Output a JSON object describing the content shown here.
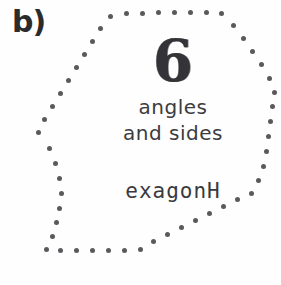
{
  "item": {
    "label": "b)"
  },
  "card": {
    "number": "6",
    "descriptor_line_1": "angles",
    "descriptor_line_2": "and sides",
    "shape_word": "exagonH"
  },
  "shape": {
    "name": "hexagon-outline",
    "sides": 6,
    "border_style": "dotted",
    "dot_color": "#5a5a5e",
    "dot_diameter_px": 5,
    "background_color": "#fefefe",
    "ink_color": "#3c3c40",
    "vertices": [
      [
        112,
        14
      ],
      [
        218,
        14
      ],
      [
        273,
        92
      ],
      [
        248,
        196
      ],
      [
        148,
        252
      ],
      [
        42,
        133
      ]
    ],
    "dot_path": [
      [
        38,
        132
      ],
      [
        44,
        119
      ],
      [
        52,
        106
      ],
      [
        60,
        93
      ],
      [
        68,
        80
      ],
      [
        76,
        67
      ],
      [
        84,
        54
      ],
      [
        92,
        41
      ],
      [
        100,
        28
      ],
      [
        110,
        16
      ],
      [
        126,
        13
      ],
      [
        142,
        13
      ],
      [
        158,
        12
      ],
      [
        174,
        12
      ],
      [
        190,
        12
      ],
      [
        206,
        12
      ],
      [
        221,
        13
      ],
      [
        233,
        25
      ],
      [
        243,
        38
      ],
      [
        252,
        51
      ],
      [
        261,
        64
      ],
      [
        269,
        78
      ],
      [
        274,
        92
      ],
      [
        272,
        106
      ],
      [
        270,
        121
      ],
      [
        268,
        136
      ],
      [
        266,
        151
      ],
      [
        263,
        166
      ],
      [
        258,
        180
      ],
      [
        251,
        193
      ],
      [
        237,
        199
      ],
      [
        223,
        206
      ],
      [
        209,
        213
      ],
      [
        195,
        220
      ],
      [
        181,
        227
      ],
      [
        167,
        234
      ],
      [
        153,
        241
      ],
      [
        140,
        249
      ],
      [
        124,
        250
      ],
      [
        108,
        250
      ],
      [
        92,
        250
      ],
      [
        76,
        250
      ],
      [
        60,
        250
      ],
      [
        46,
        249
      ],
      [
        52,
        236
      ],
      [
        56,
        222
      ],
      [
        59,
        208
      ],
      [
        61,
        193
      ],
      [
        59,
        178
      ],
      [
        55,
        163
      ],
      [
        49,
        148
      ]
    ]
  }
}
